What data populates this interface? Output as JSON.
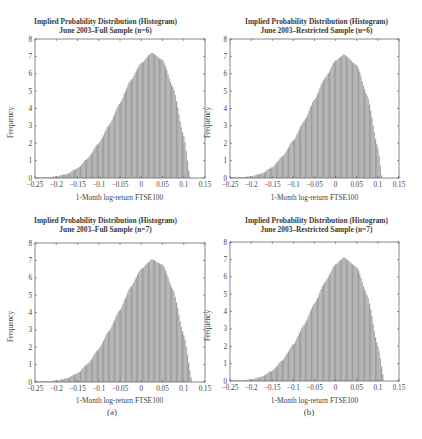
{
  "figure": {
    "sublabels": [
      "(a)",
      "(b)"
    ],
    "style": {
      "bar_fill": "#9a9a9a",
      "bar_edge": "#c8c8c8",
      "axis_color": "#555555",
      "background": "#ffffff"
    }
  },
  "panels": [
    {
      "title_line1": "Implied Probability Distribution (Histogram)",
      "title_line2": "June 2003–Full Sample (n=6)",
      "xlabel": "1-Month log-return FTSE100",
      "ylabel": "Frequency"
    },
    {
      "title_line1": "Implied Probability Distribution (Histogram)",
      "title_line2": "June 2003–Restricted Sample (n=6)",
      "xlabel": "1-Month log-return FTSE100",
      "ylabel": "Frequency"
    },
    {
      "title_line1": "Implied Probability Distribution (Histogram)",
      "title_line2": "June 2003–Full Sample (n=7)",
      "xlabel": "1-Month log-return FTSE100",
      "ylabel": "Frequency"
    },
    {
      "title_line1": "Implied Probability Distribution (Histogram)",
      "title_line2": "June 2003–Restricted Sample (n=7)",
      "xlabel": "1-Month log-return FTSE100",
      "ylabel": "Frequency"
    }
  ],
  "chart_data": [
    {
      "type": "bar",
      "title": "Implied Probability Distribution (Histogram) June 2003–Full Sample (n=6)",
      "xlabel": "1-Month log-return FTSE100",
      "ylabel": "Frequency",
      "xlim": [
        -0.25,
        0.15
      ],
      "ylim": [
        0,
        8
      ],
      "xticks": [
        -0.25,
        -0.2,
        -0.15,
        -0.1,
        -0.05,
        0,
        0.05,
        0.1,
        0.15
      ],
      "xtick_labels": [
        "-0.25",
        "-0.2",
        "-0.15",
        "-0.1",
        "-0.05",
        "0",
        "0.05",
        "0.1",
        "0.15"
      ],
      "yticks": [
        0,
        1,
        2,
        3,
        4,
        5,
        6,
        7,
        8
      ],
      "grid": false,
      "legend": null,
      "x": [
        -0.225,
        -0.2,
        -0.175,
        -0.15,
        -0.125,
        -0.1,
        -0.075,
        -0.05,
        -0.025,
        0,
        0.025,
        0.05,
        0.075,
        0.1,
        0.115
      ],
      "values": [
        0.02,
        0.08,
        0.22,
        0.55,
        1.15,
        2.0,
        3.05,
        4.3,
        5.6,
        6.6,
        7.2,
        6.8,
        5.2,
        2.4,
        0.0
      ],
      "peak": {
        "x": 0.025,
        "y": 7.2
      }
    },
    {
      "type": "bar",
      "title": "Implied Probability Distribution (Histogram) June 2003–Restricted Sample (n=6)",
      "xlabel": "1-Month log-return FTSE100",
      "ylabel": "Frequency",
      "xlim": [
        -0.25,
        0.15
      ],
      "ylim": [
        0,
        8
      ],
      "xticks": [
        -0.25,
        -0.2,
        -0.15,
        -0.1,
        -0.05,
        0,
        0.05,
        0.1,
        0.15
      ],
      "xtick_labels": [
        "-0.25",
        "-0.2",
        "-0.15",
        "-0.1",
        "-0.05",
        "0",
        "0.05",
        "0.1",
        "0.15"
      ],
      "yticks": [
        0,
        1,
        2,
        3,
        4,
        5,
        6,
        7,
        8
      ],
      "grid": false,
      "legend": null,
      "x": [
        -0.225,
        -0.2,
        -0.175,
        -0.15,
        -0.125,
        -0.1,
        -0.075,
        -0.05,
        -0.025,
        0,
        0.02,
        0.05,
        0.075,
        0.1,
        0.11
      ],
      "values": [
        0.02,
        0.09,
        0.25,
        0.6,
        1.25,
        2.15,
        3.25,
        4.5,
        5.75,
        6.75,
        7.1,
        6.5,
        4.7,
        1.7,
        0.0
      ],
      "peak": {
        "x": 0.02,
        "y": 7.1
      }
    },
    {
      "type": "bar",
      "title": "Implied Probability Distribution (Histogram) June 2003–Full Sample (n=7)",
      "xlabel": "1-Month log-return FTSE100",
      "ylabel": "Frequency",
      "xlim": [
        -0.25,
        0.15
      ],
      "ylim": [
        0,
        8
      ],
      "xticks": [
        -0.25,
        -0.2,
        -0.15,
        -0.1,
        -0.05,
        0,
        0.05,
        0.1,
        0.15
      ],
      "xtick_labels": [
        "-0.25",
        "-0.2",
        "-0.15",
        "-0.1",
        "-0.05",
        "0",
        "0.05",
        "0.1",
        "0.15"
      ],
      "yticks": [
        0,
        1,
        2,
        3,
        4,
        5,
        6,
        7,
        8
      ],
      "grid": false,
      "legend": null,
      "x": [
        -0.225,
        -0.2,
        -0.175,
        -0.15,
        -0.125,
        -0.1,
        -0.075,
        -0.05,
        -0.025,
        0,
        0.025,
        0.05,
        0.075,
        0.1,
        0.12
      ],
      "values": [
        0.02,
        0.07,
        0.2,
        0.5,
        1.05,
        1.9,
        2.95,
        4.15,
        5.45,
        6.5,
        7.05,
        6.75,
        5.3,
        2.7,
        0.0
      ],
      "peak": {
        "x": 0.025,
        "y": 7.05
      }
    },
    {
      "type": "bar",
      "title": "Implied Probability Distribution (Histogram) June 2003–Restricted Sample (n=7)",
      "xlabel": "1-Month log-return FTSE100",
      "ylabel": "Frequency",
      "xlim": [
        -0.25,
        0.15
      ],
      "ylim": [
        0,
        8
      ],
      "xticks": [
        -0.25,
        -0.2,
        -0.15,
        -0.1,
        -0.05,
        0,
        0.05,
        0.1,
        0.15
      ],
      "xtick_labels": [
        "-0.25",
        "-0.2",
        "-0.15",
        "-0.1",
        "-0.05",
        "0",
        "0.05",
        "0.1",
        "0.15"
      ],
      "yticks": [
        0,
        1,
        2,
        3,
        4,
        5,
        6,
        7,
        8
      ],
      "grid": false,
      "legend": null,
      "x": [
        -0.225,
        -0.2,
        -0.175,
        -0.15,
        -0.125,
        -0.1,
        -0.075,
        -0.05,
        -0.025,
        0,
        0.02,
        0.05,
        0.075,
        0.1,
        0.115
      ],
      "values": [
        0.02,
        0.08,
        0.24,
        0.58,
        1.2,
        2.1,
        3.2,
        4.45,
        5.7,
        6.7,
        7.1,
        6.55,
        4.9,
        2.0,
        0.0
      ],
      "peak": {
        "x": 0.02,
        "y": 7.1
      }
    }
  ]
}
